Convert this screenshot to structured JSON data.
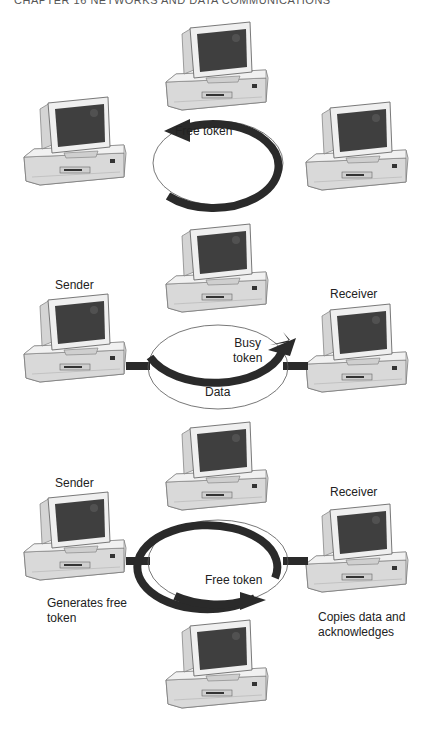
{
  "header": {
    "text": "CHAPTER 16   NETWORKS AND DATA COMMUNICATIONS"
  },
  "colors": {
    "arrow": "#2a2a2a",
    "screen": "#3f3f3f",
    "case": "#e9e9e9",
    "outline": "#777777"
  },
  "panels": [
    {
      "id": "panel-1",
      "description": "Free token circulates",
      "token_label": "Free token",
      "labels": []
    },
    {
      "id": "panel-2",
      "description": "Sender transmits data with busy token",
      "token_label_line1": "Busy",
      "token_label_line2": "token",
      "data_label": "Data",
      "sender_label": "Sender",
      "receiver_label": "Receiver"
    },
    {
      "id": "panel-3",
      "description": "Sender generates free token; receiver copies data",
      "token_label": "Free token",
      "sender_label": "Sender",
      "receiver_label": "Receiver",
      "sender_note_line1": "Generates free",
      "sender_note_line2": "token",
      "receiver_note_line1": "Copies data and",
      "receiver_note_line2": "acknowledges"
    }
  ]
}
